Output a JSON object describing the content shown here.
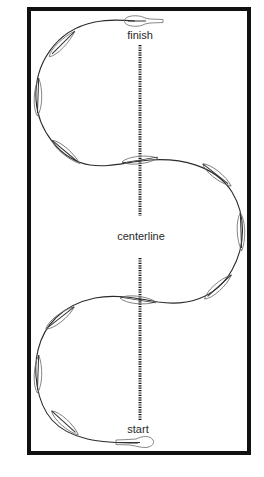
{
  "diagram": {
    "type": "serpentine-course",
    "labels": {
      "finish": "finish",
      "centerline": "centerline",
      "start": "start"
    },
    "colors": {
      "frame": "#111111",
      "path": "#2b2b2b",
      "boat_outline": "#6a6a6a",
      "text": "#2a2a2a",
      "background": "#ffffff"
    },
    "frame": {
      "x": 27,
      "y": 7,
      "width": 224,
      "height": 448
    },
    "centerline": {
      "x": 140,
      "segments": [
        [
          45,
          215
        ],
        [
          258,
          422
        ]
      ]
    },
    "loops": 3,
    "boat_markers": 15
  }
}
